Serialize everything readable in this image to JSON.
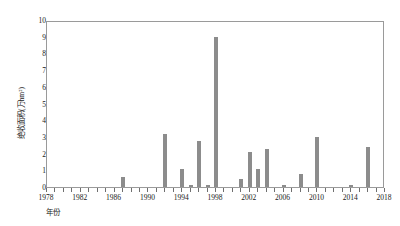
{
  "chart_data": {
    "type": "bar",
    "title": "",
    "subtitle": "",
    "xlabel": "年份",
    "ylabel": "绝收面积(万hm²)",
    "xlim": [
      1978,
      2018
    ],
    "ylim": [
      0,
      10
    ],
    "grid": false,
    "legend": null,
    "bar_color": "#8c8c8c",
    "axis_color": "#9a9a9a",
    "ytick_labels": [
      "0",
      "1",
      "2",
      "3",
      "4",
      "5",
      "6",
      "7",
      "8",
      "9",
      "10"
    ],
    "ytick_values": [
      0,
      1,
      2,
      3,
      4,
      5,
      6,
      7,
      8,
      9,
      10
    ],
    "xtick_labels": [
      "1978",
      "1982",
      "1986",
      "1990",
      "1994",
      "1998",
      "2002",
      "2006",
      "2010",
      "2014",
      "2018"
    ],
    "xtick_values": [
      1978,
      1982,
      1986,
      1990,
      1994,
      1998,
      2002,
      2006,
      2010,
      2014,
      2018
    ],
    "xtick_minor_values": [
      1979,
      1980,
      1981,
      1983,
      1984,
      1985,
      1987,
      1988,
      1989,
      1991,
      1992,
      1993,
      1995,
      1996,
      1997,
      1999,
      2000,
      2001,
      2003,
      2004,
      2005,
      2007,
      2008,
      2009,
      2011,
      2012,
      2013,
      2015,
      2016,
      2017
    ],
    "categories": [
      1978,
      1979,
      1980,
      1981,
      1982,
      1983,
      1984,
      1985,
      1986,
      1987,
      1988,
      1989,
      1990,
      1991,
      1992,
      1993,
      1994,
      1995,
      1996,
      1997,
      1998,
      1999,
      2000,
      2001,
      2002,
      2003,
      2004,
      2005,
      2006,
      2007,
      2008,
      2009,
      2010,
      2011,
      2012,
      2013,
      2014,
      2015,
      2016,
      2017,
      2018
    ],
    "values": [
      0,
      0,
      0,
      0,
      0,
      0,
      0,
      0,
      0,
      0.6,
      0,
      0,
      0,
      0,
      3.2,
      0,
      1.1,
      0.1,
      2.75,
      0.15,
      9.0,
      0,
      0,
      0.5,
      2.1,
      1.05,
      2.25,
      0,
      0.15,
      0,
      0.8,
      0,
      3.0,
      0,
      0,
      0,
      0.12,
      0,
      2.4,
      0,
      0
    ]
  }
}
